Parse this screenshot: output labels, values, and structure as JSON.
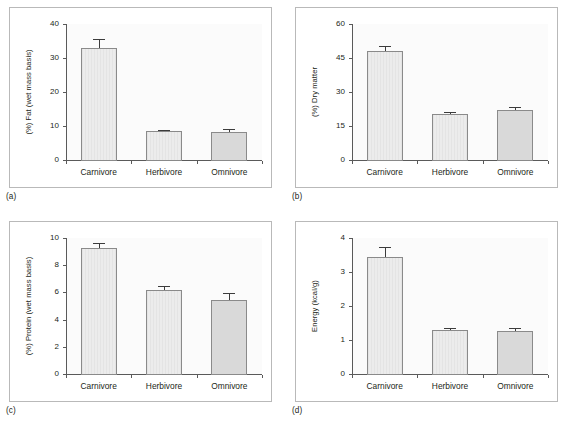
{
  "figure": {
    "panel_count": 4,
    "categories": [
      "Carnivore",
      "Herbivore",
      "Omnivore"
    ],
    "bar_color_light": "#ececec",
    "bar_color_dark": "#d9d9d9",
    "axis_color": "#5a5a5a",
    "border_color": "#b9b9b9"
  },
  "panels": [
    {
      "tag": "(a)",
      "ylabel": "(%) Fat (wet mass basis)",
      "yticks": [
        "0",
        "10",
        "20",
        "30",
        "40"
      ],
      "xticklabels": [
        "Carnivore",
        "Herbivore",
        "Omnivore"
      ]
    },
    {
      "tag": "(b)",
      "ylabel": "(%) Dry matter",
      "yticks": [
        "0",
        "15",
        "30",
        "45",
        "60"
      ],
      "xticklabels": [
        "Carnivore",
        "Herbivore",
        "Omnivore"
      ]
    },
    {
      "tag": "(c)",
      "ylabel": "(%) Protein (wet mass basis)",
      "yticks": [
        "0",
        "2",
        "4",
        "6",
        "8",
        "10"
      ],
      "xticklabels": [
        "Carnivore",
        "Herbivore",
        "Omnivore"
      ]
    },
    {
      "tag": "(d)",
      "ylabel": "Energy (kcal/g)",
      "yticks": [
        "0",
        "1",
        "2",
        "3",
        "4"
      ],
      "xticklabels": [
        "Carnivore",
        "Herbivore",
        "Omnivore"
      ]
    }
  ],
  "chart_data": [
    {
      "type": "bar",
      "panel": "(a)",
      "title": "",
      "xlabel": "",
      "ylabel": "(%) Fat (wet mass basis)",
      "categories": [
        "Carnivore",
        "Herbivore",
        "Omnivore"
      ],
      "values": [
        32.8,
        8.4,
        8.2
      ],
      "errors": [
        2.7,
        0.3,
        1.0
      ],
      "ylim": [
        0,
        40
      ],
      "yticks": [
        0,
        10,
        20,
        30,
        40
      ],
      "grid": false,
      "legend": "none"
    },
    {
      "type": "bar",
      "panel": "(b)",
      "title": "",
      "xlabel": "",
      "ylabel": "(%) Dry matter",
      "categories": [
        "Carnivore",
        "Herbivore",
        "Omnivore"
      ],
      "values": [
        48.0,
        20.5,
        22.0
      ],
      "errors": [
        2.3,
        0.6,
        1.4
      ],
      "ylim": [
        0,
        60
      ],
      "yticks": [
        0,
        15,
        30,
        45,
        60
      ],
      "grid": false,
      "legend": "none"
    },
    {
      "type": "bar",
      "panel": "(c)",
      "title": "",
      "xlabel": "",
      "ylabel": "(%) Protein (wet mass basis)",
      "categories": [
        "Carnivore",
        "Herbivore",
        "Omnivore"
      ],
      "values": [
        9.25,
        6.15,
        5.45
      ],
      "errors": [
        0.35,
        0.35,
        0.5
      ],
      "ylim": [
        0,
        10
      ],
      "yticks": [
        0,
        2,
        4,
        6,
        8,
        10
      ],
      "grid": false,
      "legend": "none"
    },
    {
      "type": "bar",
      "panel": "(d)",
      "title": "",
      "xlabel": "",
      "ylabel": "Energy (kcal/g)",
      "categories": [
        "Carnivore",
        "Herbivore",
        "Omnivore"
      ],
      "values": [
        3.43,
        1.3,
        1.27
      ],
      "errors": [
        0.32,
        0.06,
        0.09
      ],
      "ylim": [
        0,
        4
      ],
      "yticks": [
        0,
        1,
        2,
        3,
        4
      ],
      "grid": false,
      "legend": "none"
    }
  ]
}
